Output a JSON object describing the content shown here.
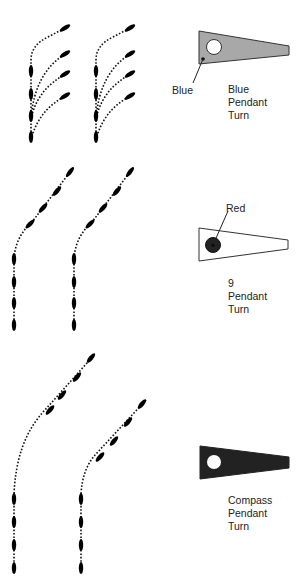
{
  "diagram": {
    "title": "",
    "sections": [
      {
        "id": "blue-pendant-turn",
        "pendant": {
          "fill": "#a8a8a8",
          "stroke": "#333333",
          "circle_fill": "#ffffff",
          "callout": "Blue"
        },
        "caption": [
          "Blue",
          "Pendant",
          "Turn"
        ],
        "columns": 2,
        "description": "Ships turn simultaneously, each peeling off from column"
      },
      {
        "id": "9-pendant-turn",
        "pendant": {
          "fill": "#ffffff",
          "stroke": "#333333",
          "circle_fill": "#222222",
          "callout": "Red"
        },
        "caption": [
          "9",
          "Pendant",
          "Turn"
        ],
        "columns": 2,
        "description": "Column turns in succession at a gentle angle"
      },
      {
        "id": "compass-pendant-turn",
        "pendant": {
          "fill": "#222222",
          "stroke": "#222222",
          "circle_fill": "#ffffff",
          "callout": ""
        },
        "caption": [
          "Compass",
          "Pendant",
          "Turn"
        ],
        "columns": 2,
        "description": "Column turns in succession on a wider arc"
      }
    ]
  }
}
